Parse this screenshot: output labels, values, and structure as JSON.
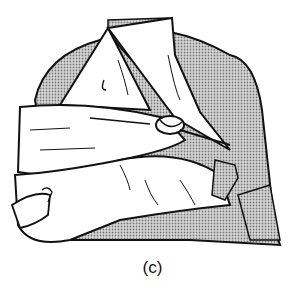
{
  "figure": {
    "caption": "(c)"
  },
  "colors": {
    "line": "#111111",
    "shading": "#a8a8a8",
    "background": "#ffffff",
    "bandage": "#ffffff"
  }
}
